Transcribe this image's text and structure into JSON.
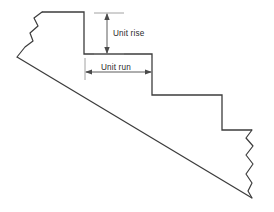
{
  "figure": {
    "background_color": "#ffffff",
    "line_color": "#3c3c3c",
    "dimension_color": "#4a4a4a",
    "width": 274,
    "height": 212
  },
  "annotations": {
    "unit_rise": {
      "label": "Unit rise",
      "orientation": "vertical",
      "label_x": 110,
      "label_y": 33,
      "line_x": 107,
      "line_top_y": 13,
      "line_bottom_y": 54
    },
    "unit_run": {
      "label": "Unit run",
      "orientation": "horizontal",
      "label_x": 100,
      "label_y": 72,
      "line_y": 72,
      "line_left_x": 85,
      "line_right_x": 152
    }
  },
  "geometry": {
    "stair_outline": "M 42,12 L 84,12 L 84,54 L 152,54 L 152,95 L 222,95 L 222,130 L 252,130",
    "slope_line": "M 17,57 L 252,198",
    "left_break_line": "M 42,12 L 34,18 L 38,26 L 30,33 L 33,41 L 25,47 L 17,57",
    "right_break_line": "M 252,130 L 246,138 L 253,146 L 246,155 L 253,164 L 246,174 L 252,183 L 248,191 L 252,198",
    "steps": [
      {
        "tread_y": 12,
        "riser_x": 84
      },
      {
        "tread_y": 54,
        "riser_x": 152
      },
      {
        "tread_y": 95,
        "riser_x": 222
      },
      {
        "tread_y": 130,
        "riser_x": 252
      }
    ]
  }
}
